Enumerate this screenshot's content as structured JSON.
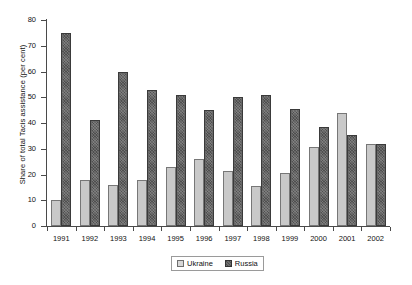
{
  "chart_data": {
    "type": "bar",
    "title": "",
    "xlabel": "",
    "ylabel": "Share of total Tacis assistance (per cent)",
    "categories": [
      "1991",
      "1992",
      "1993",
      "1994",
      "1995",
      "1996",
      "1997",
      "1998",
      "1999",
      "2000",
      "2001",
      "2002"
    ],
    "series": [
      {
        "name": "Ukraine",
        "color": "#c9c9c9",
        "values": [
          10,
          18,
          16,
          18,
          23,
          26,
          21.5,
          15.5,
          20.5,
          30.5,
          44,
          32
        ]
      },
      {
        "name": "Russia",
        "color": "#4f4f4f",
        "values": [
          75,
          41,
          60,
          53,
          51,
          45,
          50,
          51,
          45.5,
          38.5,
          35.5,
          32
        ]
      }
    ],
    "ylim": [
      0,
      80
    ],
    "yticks": [
      0,
      10,
      20,
      30,
      40,
      50,
      60,
      70,
      80
    ],
    "ytick_labels": [
      "0",
      "10",
      "20",
      "30",
      "40",
      "50",
      "60",
      "70",
      "80"
    ],
    "grid": false,
    "legend_position": "bottom-center"
  },
  "legend": {
    "entries": [
      {
        "label": "Ukraine",
        "swatch": "ukraine"
      },
      {
        "label": "Russia",
        "swatch": "russia"
      }
    ]
  }
}
